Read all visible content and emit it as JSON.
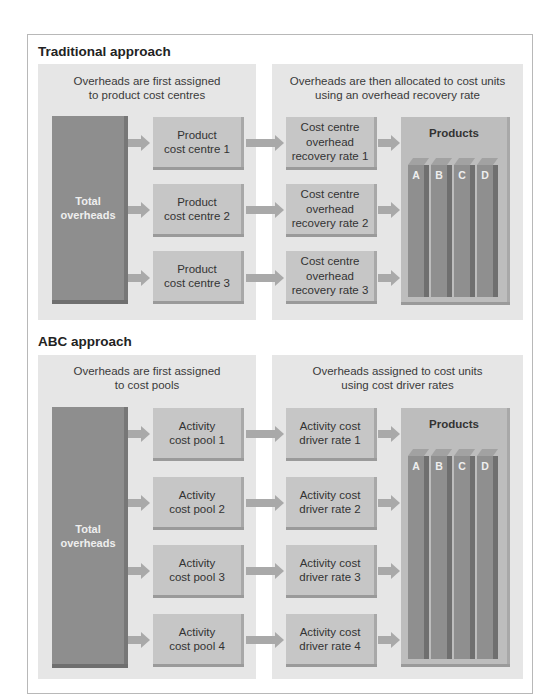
{
  "traditional": {
    "title": "Traditional approach",
    "left_caption": "Overheads are first assigned\nto product cost centres",
    "right_caption": "Overheads are then allocated to cost units\nusing an overhead recovery rate",
    "total_label": "Total\noverheads",
    "centres": [
      "Product\ncost centre 1",
      "Product\ncost centre 2",
      "Product\ncost centre 3"
    ],
    "rates": [
      "Cost centre\noverhead\nrecovery rate 1",
      "Cost centre\noverhead\nrecovery rate 2",
      "Cost centre\noverhead\nrecovery rate 3"
    ],
    "products_label": "Products",
    "product_bars": [
      "A",
      "B",
      "C",
      "D"
    ]
  },
  "abc": {
    "title": "ABC approach",
    "left_caption": "Overheads are first assigned\nto cost pools",
    "right_caption": "Overheads assigned to cost units\nusing cost driver rates",
    "total_label": "Total\noverheads",
    "pools": [
      "Activity\ncost pool 1",
      "Activity\ncost pool 2",
      "Activity\ncost pool 3",
      "Activity\ncost pool 4"
    ],
    "rates": [
      "Activity cost\ndriver rate 1",
      "Activity cost\ndriver rate 2",
      "Activity cost\ndriver rate 3",
      "Activity cost\ndriver rate 4"
    ],
    "products_label": "Products",
    "product_bars": [
      "A",
      "B",
      "C",
      "D"
    ]
  },
  "colors": {
    "panel": "#e6e6e6",
    "box": "#c6c6c6",
    "total": "#8e8e8e",
    "arrow": "#a9a9a9"
  }
}
